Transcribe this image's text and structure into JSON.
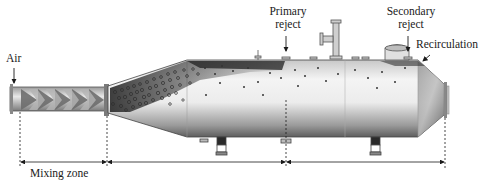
{
  "diagram": {
    "type": "process-equipment-cross-section",
    "labels": {
      "air": "Air",
      "primary_reject": [
        "Primary",
        "reject"
      ],
      "secondary_reject": [
        "Secondary",
        "reject"
      ],
      "recirculation": "Recirculation",
      "mixing_zone": "Mixing zone"
    },
    "zones": [
      {
        "name": "mixing-zone",
        "label": "Mixing zone",
        "x_start": 20,
        "x_end": 107
      },
      {
        "name": "primary-zone",
        "label": "",
        "x_start": 107,
        "x_end": 286
      },
      {
        "name": "secondary-zone",
        "label": "",
        "x_start": 286,
        "x_end": 445
      }
    ],
    "colors": {
      "line": "#1a1a1a",
      "vessel_light": "#f4f4f4",
      "vessel_dark": "#6a6a6a",
      "bubble": "#3a3a3a",
      "froth": "#222222"
    }
  }
}
